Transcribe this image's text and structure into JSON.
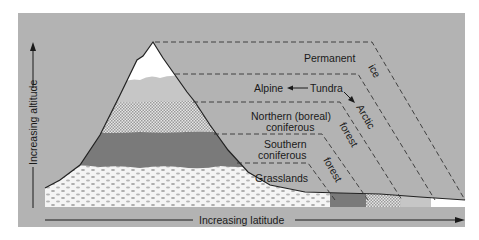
{
  "diagram": {
    "y_axis_label": "Increasing altitude",
    "x_axis_label": "Increasing latitude",
    "zones": [
      {
        "id": "ice",
        "labels": [
          "Permanent",
          "ice"
        ],
        "color": "#ffffff"
      },
      {
        "id": "tundra",
        "labels": [
          "Alpine",
          "Tundra",
          "Arctic"
        ],
        "color": "#c4c4c4"
      },
      {
        "id": "boreal",
        "labels": [
          "Northern (boreal)",
          "coniferous",
          "forest"
        ],
        "color": "#d9d9d9",
        "pattern": "crosshatch"
      },
      {
        "id": "southern",
        "labels": [
          "Southern",
          "coniferous",
          "forest"
        ],
        "color": "#7a7a7a"
      },
      {
        "id": "grasslands",
        "labels": [
          "Grasslands"
        ],
        "color": "#f2f2f2",
        "pattern": "dots"
      }
    ],
    "colors": {
      "background": "#b3b3b3",
      "outline": "#222222",
      "dashes": "#333333"
    }
  }
}
